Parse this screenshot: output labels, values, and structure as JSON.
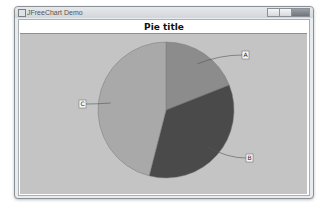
{
  "window": {
    "title": "JFreeChart Demo",
    "controls": [
      "minimize",
      "maximize",
      "close"
    ]
  },
  "chart_data": {
    "type": "pie",
    "title": "Pie title",
    "categories": [
      "A",
      "B",
      "C"
    ],
    "values": [
      19,
      35,
      46
    ],
    "colors": [
      "#8c8c8c",
      "#4a4a4a",
      "#a9a9a9"
    ],
    "start_angle_deg": 0,
    "direction": "clockwise",
    "legend": "none",
    "labels_shown": true
  }
}
